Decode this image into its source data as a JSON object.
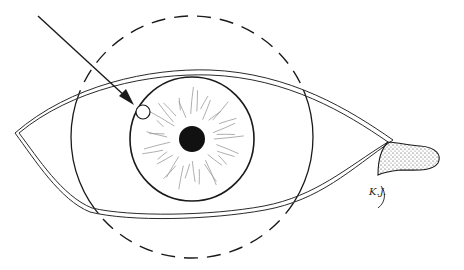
{
  "figure": {
    "signature": "K.J.",
    "colors": {
      "background": "#ffffff",
      "ink": "#1a1a1a",
      "iris_fibers": "#9a9a9a",
      "stipple": "#333333"
    },
    "elements": {
      "arrow": {
        "x1": 38,
        "y1": 16,
        "x2": 133,
        "y2": 104
      },
      "target_circle": {
        "cx": 143,
        "cy": 112,
        "r": 7
      },
      "iris": {
        "cx": 192,
        "cy": 139,
        "r": 62
      },
      "pupil": {
        "cx": 192,
        "cy": 139,
        "r": 13
      },
      "outer_circle": {
        "cx": 192,
        "cy": 137,
        "r": 121
      },
      "eye_left_corner": {
        "x": 15,
        "y": 133
      },
      "eye_right_corner": {
        "x": 395,
        "y": 143
      }
    }
  }
}
